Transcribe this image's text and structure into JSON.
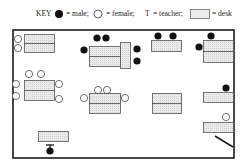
{
  "key": {
    "title": "KEY",
    "male_label": "= male;",
    "female_label": "= female;",
    "teacher_symbol": "T",
    "teacher_label": "= teacher;",
    "desk_label": "= desk"
  },
  "colors": {
    "male": "#111111",
    "female_fill": "#ffffff",
    "outline": "#333333",
    "desk_fill": "#e6e6e6",
    "wall": "#1a1a1a"
  },
  "room": {
    "x": 13,
    "y": 30,
    "width": 221,
    "height": 128
  },
  "desks": [
    {
      "x": 24,
      "y": 34,
      "w": 30,
      "h": 9
    },
    {
      "x": 24,
      "y": 43,
      "w": 30,
      "h": 9
    },
    {
      "x": 89,
      "y": 46,
      "w": 31,
      "h": 10
    },
    {
      "x": 89,
      "y": 56,
      "w": 31,
      "h": 10
    },
    {
      "x": 120,
      "y": 42,
      "w": 10,
      "h": 26
    },
    {
      "x": 151,
      "y": 40,
      "w": 30,
      "h": 11
    },
    {
      "x": 203,
      "y": 40,
      "w": 30,
      "h": 11
    },
    {
      "x": 203,
      "y": 51,
      "w": 30,
      "h": 11
    },
    {
      "x": 24,
      "y": 80,
      "w": 30,
      "h": 10
    },
    {
      "x": 24,
      "y": 90,
      "w": 30,
      "h": 10
    },
    {
      "x": 89,
      "y": 93,
      "w": 31,
      "h": 10
    },
    {
      "x": 89,
      "y": 103,
      "w": 31,
      "h": 10
    },
    {
      "x": 152,
      "y": 93,
      "w": 29,
      "h": 10
    },
    {
      "x": 152,
      "y": 103,
      "w": 29,
      "h": 10
    },
    {
      "x": 203,
      "y": 92,
      "w": 30,
      "h": 10
    },
    {
      "x": 203,
      "y": 122,
      "w": 30,
      "h": 10
    },
    {
      "x": 38,
      "y": 131,
      "w": 30,
      "h": 10
    }
  ],
  "students": [
    {
      "sex": "female",
      "x": 18,
      "y": 39
    },
    {
      "sex": "female",
      "x": 18,
      "y": 48
    },
    {
      "sex": "male",
      "x": 97,
      "y": 38
    },
    {
      "sex": "male",
      "x": 106,
      "y": 38
    },
    {
      "sex": "male",
      "x": 84,
      "y": 50
    },
    {
      "sex": "male",
      "x": 137,
      "y": 49
    },
    {
      "sex": "male",
      "x": 137,
      "y": 61
    },
    {
      "sex": "male",
      "x": 158,
      "y": 36
    },
    {
      "sex": "male",
      "x": 173,
      "y": 36
    },
    {
      "sex": "male",
      "x": 211,
      "y": 36
    },
    {
      "sex": "male",
      "x": 199,
      "y": 47
    },
    {
      "sex": "female",
      "x": 29,
      "y": 74
    },
    {
      "sex": "female",
      "x": 41,
      "y": 74
    },
    {
      "sex": "female",
      "x": 16,
      "y": 84
    },
    {
      "sex": "female",
      "x": 16,
      "y": 96
    },
    {
      "sex": "female",
      "x": 59,
      "y": 84
    },
    {
      "sex": "female",
      "x": 59,
      "y": 99
    },
    {
      "sex": "female",
      "x": 98,
      "y": 90
    },
    {
      "sex": "female",
      "x": 107,
      "y": 90
    },
    {
      "sex": "female",
      "x": 84,
      "y": 98
    },
    {
      "sex": "female",
      "x": 125,
      "y": 98
    },
    {
      "sex": "male",
      "x": 226,
      "y": 88
    },
    {
      "sex": "female",
      "x": 226,
      "y": 117
    }
  ],
  "teacher": {
    "x": 50,
    "y": 145,
    "symbol": "T"
  },
  "door": {
    "x1": 215,
    "y1": 136,
    "x2": 233,
    "y2": 147
  }
}
